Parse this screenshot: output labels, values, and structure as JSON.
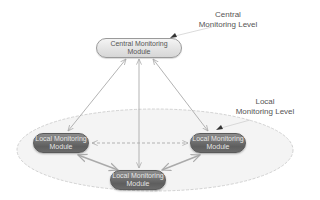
{
  "diagram": {
    "type": "hierarchical monitoring architecture",
    "levels": {
      "central": {
        "line1": "Central",
        "line2": "Monitoring Level"
      },
      "local": {
        "line1": "Local",
        "line2": "Monitoring Level"
      }
    },
    "nodes": {
      "central": {
        "line1": "Central Monitoring",
        "line2": "Module"
      },
      "local_left": {
        "line1": "Local Monitoring",
        "line2": "Module"
      },
      "local_right": {
        "line1": "Local Monitoring",
        "line2": "Module"
      },
      "local_bottom": {
        "line1": "Local Monitoring",
        "line2": "Module"
      }
    },
    "edges": [
      {
        "from": "central",
        "to": "local_left",
        "style": "solid",
        "direction": "bidirectional"
      },
      {
        "from": "central",
        "to": "local_bottom",
        "style": "solid",
        "direction": "bidirectional"
      },
      {
        "from": "central",
        "to": "local_right",
        "style": "solid",
        "direction": "bidirectional"
      },
      {
        "from": "local_left",
        "to": "local_right",
        "style": "dashed",
        "direction": "bidirectional"
      },
      {
        "from": "local_left",
        "to": "local_bottom",
        "style": "solid",
        "direction": "bidirectional"
      },
      {
        "from": "local_right",
        "to": "local_bottom",
        "style": "solid",
        "direction": "bidirectional"
      }
    ],
    "colors": {
      "central_node_fill": "#e6e6e6",
      "local_node_fill": "#6e6e6e",
      "edge": "#aaaaaa",
      "ellipse_fill": "#f4f4f4",
      "ellipse_stroke": "#c8c8c8",
      "text": "#555555"
    }
  }
}
